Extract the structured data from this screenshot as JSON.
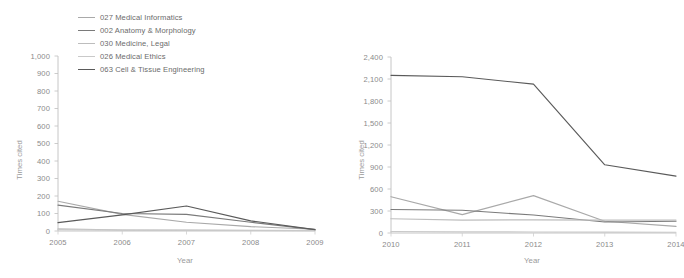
{
  "legend": {
    "position": "top-left",
    "items": [
      {
        "label": "027 Medical Informatics",
        "color": "#a9a9a9"
      },
      {
        "label": "002 Anatomy & Morphology",
        "color": "#7a7a7a"
      },
      {
        "label": "030 Medicine, Legal",
        "color": "#bdbdbd"
      },
      {
        "label": "026 Medical Ethics",
        "color": "#c9c9c9"
      },
      {
        "label": "063 Cell & Tissue Engineering",
        "color": "#5a5a5a"
      }
    ]
  },
  "chart_data": [
    {
      "type": "line",
      "title": "",
      "panel": "left",
      "xlabel": "Year",
      "ylabel": "Times cited",
      "x": [
        "2005",
        "2006",
        "2007",
        "2008",
        "2009"
      ],
      "categories": [
        "2005",
        "2006",
        "2007",
        "2008",
        "2009"
      ],
      "ylim": [
        0,
        1000
      ],
      "yticks": [
        "0",
        "100",
        "200",
        "300",
        "400",
        "500",
        "600",
        "700",
        "800",
        "900",
        "1,000"
      ],
      "ytick_values": [
        0,
        100,
        200,
        300,
        400,
        500,
        600,
        700,
        800,
        900,
        1000
      ],
      "grid": false,
      "legend_position": "top-left",
      "series": [
        {
          "name": "027 Medical Informatics",
          "color": "#a9a9a9",
          "values": [
            170,
            95,
            50,
            25,
            10
          ]
        },
        {
          "name": "002 Anatomy & Morphology",
          "color": "#7a7a7a",
          "values": [
            148,
            100,
            95,
            50,
            8
          ]
        },
        {
          "name": "030 Medicine, Legal",
          "color": "#bdbdbd",
          "values": [
            12,
            6,
            5,
            4,
            3
          ]
        },
        {
          "name": "026 Medical Ethics",
          "color": "#c9c9c9",
          "values": [
            8,
            5,
            4,
            3,
            2
          ]
        },
        {
          "name": "063 Cell & Tissue Engineering",
          "color": "#5a5a5a",
          "values": [
            48,
            92,
            143,
            58,
            8
          ]
        }
      ]
    },
    {
      "type": "line",
      "title": "",
      "panel": "right",
      "xlabel": "Year",
      "ylabel": "Times cited",
      "x": [
        "2010",
        "2011",
        "2012",
        "2013",
        "2014"
      ],
      "categories": [
        "2010",
        "2011",
        "2012",
        "2013",
        "2014"
      ],
      "ylim": [
        0,
        2400
      ],
      "yticks": [
        "0",
        "300",
        "600",
        "900",
        "1,200",
        "1,500",
        "1,800",
        "2,100",
        "2,400"
      ],
      "ytick_values": [
        0,
        300,
        600,
        900,
        1200,
        1500,
        1800,
        2100,
        2400
      ],
      "grid": false,
      "legend_position": "top-left",
      "series": [
        {
          "name": "027 Medical Informatics",
          "color": "#a9a9a9",
          "values": [
            495,
            250,
            510,
            160,
            90
          ]
        },
        {
          "name": "002 Anatomy & Morphology",
          "color": "#7a7a7a",
          "values": [
            320,
            310,
            245,
            150,
            160
          ]
        },
        {
          "name": "030 Medicine, Legal",
          "color": "#bdbdbd",
          "values": [
            195,
            175,
            180,
            175,
            175
          ]
        },
        {
          "name": "026 Medical Ethics",
          "color": "#c9c9c9",
          "values": [
            20,
            15,
            14,
            12,
            10
          ]
        },
        {
          "name": "063 Cell & Tissue Engineering",
          "color": "#5a5a5a",
          "values": [
            2150,
            2130,
            2030,
            930,
            775
          ]
        }
      ]
    }
  ]
}
